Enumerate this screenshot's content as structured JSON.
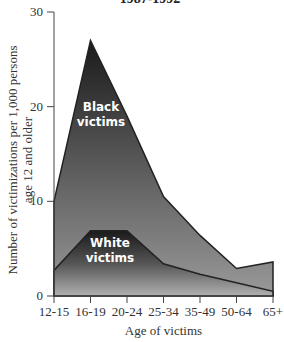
{
  "chart_data": {
    "type": "area",
    "title": "1987-1992",
    "xlabel": "Age of victims",
    "ylabel": "Number of victimizations per 1,000 persons age 12 and older",
    "ylim": [
      0,
      30
    ],
    "yticks": [
      "0",
      "10",
      "20",
      "30"
    ],
    "categories": [
      "12-15",
      "16-19",
      "20-24",
      "25-34",
      "35-49",
      "50-64",
      "65+"
    ],
    "series": [
      {
        "name": "Black victims",
        "values": [
          10,
          27,
          19,
          10.5,
          6.4,
          2.9,
          3.6
        ],
        "color": "#2a2a2a"
      },
      {
        "name": "White victims",
        "values": [
          2.7,
          6.9,
          6.9,
          3.4,
          2.3,
          1.4,
          0.5
        ],
        "color": "#1e1e1e"
      }
    ],
    "grid": false,
    "legend": "inline labels"
  },
  "labels": {
    "title": "1987-1992",
    "xlabel": "Age of victims",
    "ylabel_line1": "Number of victimizations per 1,000 persons",
    "ylabel_line2": "age 12 and older",
    "black_line1": "Black",
    "black_line2": "victims",
    "white_line1": "White",
    "white_line2": "victims"
  }
}
